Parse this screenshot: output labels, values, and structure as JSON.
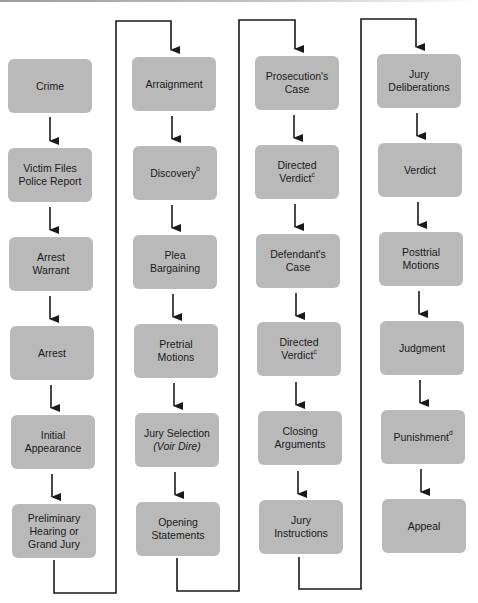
{
  "colors": {
    "box_fill": "#b9b9b9",
    "line": "#1a1a1a",
    "text": "#1a1a1a"
  },
  "columns": [
    {
      "steps": [
        {
          "label": "Crime"
        },
        {
          "label": "Victim Files Police Report",
          "lines": [
            "Victim Files",
            "Police Report"
          ]
        },
        {
          "label": "Arrest Warrant",
          "lines": [
            "Arrest",
            "Warrant"
          ]
        },
        {
          "label": "Arrest"
        },
        {
          "label": "Initial Appearance",
          "lines": [
            "Initial",
            "Appearance"
          ]
        },
        {
          "label": "Preliminary Hearing or Grand Jury",
          "lines": [
            "Preliminary",
            "Hearing or",
            "Grand Jury"
          ]
        }
      ]
    },
    {
      "steps": [
        {
          "label": "Arraignment"
        },
        {
          "label": "Discovery",
          "footnote": "b"
        },
        {
          "label": "Plea Bargaining",
          "lines": [
            "Plea",
            "Bargaining"
          ]
        },
        {
          "label": "Pretrial Motions",
          "lines": [
            "Pretrial",
            "Motions"
          ]
        },
        {
          "label": "Jury Selection (Voir Dire)",
          "lines": [
            "Jury Selection",
            "(Voir Dire)"
          ]
        },
        {
          "label": "Opening Statements",
          "lines": [
            "Opening",
            "Statements"
          ]
        }
      ]
    },
    {
      "steps": [
        {
          "label": "Prosecution's Case",
          "lines": [
            "Prosecution's",
            "Case"
          ]
        },
        {
          "label": "Directed Verdict",
          "lines": [
            "Directed",
            "Verdict"
          ],
          "footnote": "c"
        },
        {
          "label": "Defendant's Case",
          "lines": [
            "Defendant's",
            "Case"
          ]
        },
        {
          "label": "Directed Verdict",
          "lines": [
            "Directed",
            "Verdict"
          ],
          "footnote": "c"
        },
        {
          "label": "Closing Arguments",
          "lines": [
            "Closing",
            "Arguments"
          ]
        },
        {
          "label": "Jury Instructions",
          "lines": [
            "Jury",
            "Instructions"
          ]
        }
      ]
    },
    {
      "steps": [
        {
          "label": "Jury Deliberations",
          "lines": [
            "Jury",
            "Deliberations"
          ]
        },
        {
          "label": "Verdict"
        },
        {
          "label": "Posttrial Motions",
          "lines": [
            "Posttrial",
            "Motions"
          ]
        },
        {
          "label": "Judgment"
        },
        {
          "label": "Punishment",
          "footnote": "d"
        },
        {
          "label": "Appeal"
        }
      ]
    }
  ],
  "text": {
    "c1": [
      "Crime",
      "Victim Files",
      "Police Report",
      "Arrest",
      "Warrant",
      "Arrest",
      "Initial",
      "Appearance",
      "Preliminary",
      "Hearing or",
      "Grand Jury"
    ],
    "c2": [
      "Arraignment",
      "Discovery",
      "b",
      "Plea",
      "Bargaining",
      "Pretrial",
      "Motions",
      "Jury Selection",
      "(Voir Dire)",
      "Opening",
      "Statements"
    ],
    "c3": [
      "Prosecution's",
      "Case",
      "Directed",
      "Verdict",
      "c",
      "Defendant's",
      "Case",
      "Directed",
      "Verdict",
      "c",
      "Closing",
      "Arguments",
      "Jury",
      "Instructions"
    ],
    "c4": [
      "Jury",
      "Deliberations",
      "Verdict",
      "Posttrial",
      "Motions",
      "Judgment",
      "Punishment",
      "d",
      "Appeal"
    ]
  }
}
